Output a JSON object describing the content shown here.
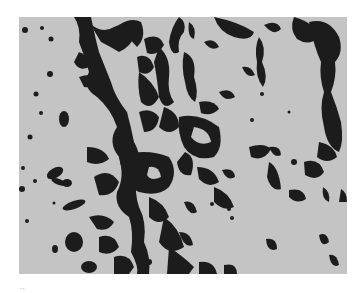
{
  "figure": {
    "type": "grayscale micrograph",
    "panel_label": "..",
    "colors": {
      "background": "#ffffff",
      "field": "#c4c4c4",
      "cells": "#1e1e1e"
    }
  }
}
